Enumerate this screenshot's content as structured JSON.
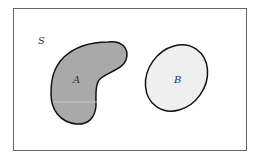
{
  "diagram": {
    "type": "venn-diagram-disjoint-sets",
    "universe": {
      "label": "S",
      "border_color": "#666666",
      "fill": "#ffffff"
    },
    "sets": [
      {
        "label": "A",
        "shape": "kidney",
        "fill": "#a9a9a9",
        "stroke": "#111111"
      },
      {
        "label": "B",
        "shape": "ellipse",
        "fill": "#efefef",
        "stroke": "#111111"
      }
    ]
  }
}
